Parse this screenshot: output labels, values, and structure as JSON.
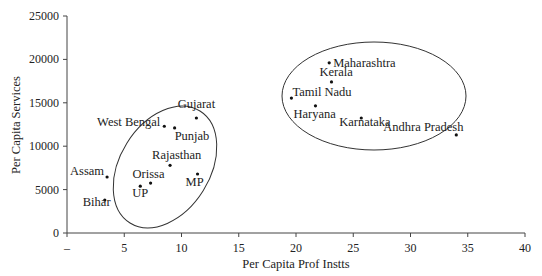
{
  "chart_data": {
    "type": "scatter",
    "title": "",
    "xlabel": "Per Capita Prof Instts",
    "ylabel": "Per Capita Services",
    "xlim": [
      0,
      40
    ],
    "ylim": [
      0,
      25000
    ],
    "x_ticks": [
      "–",
      "5",
      "10",
      "15",
      "20",
      "25",
      "30",
      "35",
      "40"
    ],
    "y_ticks": [
      "0",
      "5000",
      "10000",
      "15000",
      "20000",
      "25000"
    ],
    "grid": false,
    "legend": null,
    "points": [
      {
        "label": "Gujarat",
        "x": 11.3,
        "y": 13250
      },
      {
        "label": "West Bengal",
        "x": 8.5,
        "y": 12300
      },
      {
        "label": "Punjab",
        "x": 9.4,
        "y": 12100
      },
      {
        "label": "Rajasthan",
        "x": 9.0,
        "y": 7800
      },
      {
        "label": "Assam",
        "x": 3.5,
        "y": 6450
      },
      {
        "label": "Orissa",
        "x": 7.3,
        "y": 5750
      },
      {
        "label": "UP",
        "x": 6.4,
        "y": 5400
      },
      {
        "label": "MP",
        "x": 11.4,
        "y": 6800
      },
      {
        "label": "Bihar",
        "x": 3.3,
        "y": 3800
      },
      {
        "label": "Maharashtra",
        "x": 22.9,
        "y": 19600
      },
      {
        "label": "Kerala",
        "x": 23.1,
        "y": 17400
      },
      {
        "label": "Tamil Nadu",
        "x": 19.6,
        "y": 15550
      },
      {
        "label": "Haryana",
        "x": 21.7,
        "y": 14650
      },
      {
        "label": "Karnataka",
        "x": 25.7,
        "y": 13250
      },
      {
        "label": "Andhra Pradesh",
        "x": 34.0,
        "y": 11300
      }
    ],
    "annotations": [
      {
        "type": "ellipse",
        "group": "low cluster",
        "members": [
          "Gujarat",
          "West Bengal",
          "Punjab",
          "Rajasthan",
          "Assam",
          "Orissa",
          "UP",
          "MP",
          "Bihar"
        ]
      },
      {
        "type": "ellipse",
        "group": "high cluster",
        "members": [
          "Maharashtra",
          "Kerala",
          "Tamil Nadu",
          "Haryana",
          "Karnataka",
          "Andhra Pradesh"
        ]
      }
    ]
  }
}
